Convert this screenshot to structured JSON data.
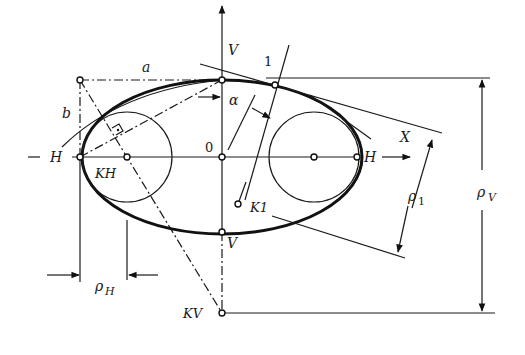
{
  "figure": {
    "type": "ellipse-curvature-construction",
    "labels": {
      "v_axis_top": "V",
      "v_axis_bottom": "V",
      "h_axis_left": "H",
      "h_axis_right": "H",
      "semi_major": "a",
      "semi_minor": "b",
      "angle": "α",
      "origin": "0",
      "point_1": "1",
      "center_kh": "KH",
      "center_k1": "K1",
      "center_kv": "KV",
      "normal_axis": "X",
      "rho_h_main": "ρ",
      "rho_h_sub": "H",
      "rho_1_main": "ρ",
      "rho_1_sub": "1",
      "rho_v_main": "ρ",
      "rho_v_sub": "V"
    },
    "geometry": {
      "center": [
        222,
        157
      ],
      "semi_axis_a": 140,
      "semi_axis_b": 77,
      "kh_center": [
        127,
        157
      ],
      "kh_radius": 45,
      "right_circle_center": [
        314,
        157
      ],
      "right_circle_radius": 45,
      "kv_point": [
        222,
        313
      ],
      "k1_point": [
        238,
        204
      ],
      "point_1": [
        275,
        85
      ],
      "corner_point": [
        80,
        80
      ]
    },
    "colors": {
      "ink": "#111111",
      "background": "#ffffff"
    }
  }
}
